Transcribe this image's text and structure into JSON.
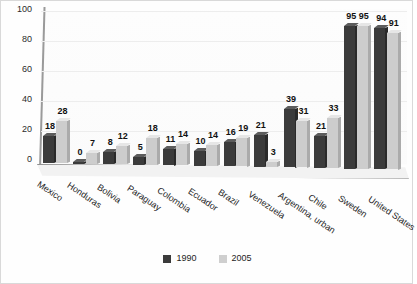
{
  "chart_data": {
    "type": "bar",
    "title": "",
    "xlabel": "",
    "ylabel": "",
    "ylim": [
      0,
      100
    ],
    "yticks": [
      0,
      20,
      40,
      60,
      80,
      100
    ],
    "grid": true,
    "legend_position": "bottom",
    "categories": [
      "Mexico",
      "Honduras",
      "Bolivia",
      "Paraguay",
      "Colombia",
      "Ecuador",
      "Brazil",
      "Venezuela",
      "Argentina, urban",
      "Chile",
      "Sweden",
      "United States"
    ],
    "series": [
      {
        "name": "1990",
        "color": "#3b3b3b",
        "values": [
          18,
          0,
          8,
          5,
          11,
          10,
          16,
          21,
          39,
          21,
          95,
          94
        ]
      },
      {
        "name": "2005",
        "color": "#cdcdcd",
        "values": [
          28,
          7,
          12,
          18,
          14,
          14,
          19,
          3,
          31,
          33,
          95,
          91
        ]
      }
    ]
  },
  "legend": {
    "items": [
      {
        "label": "1990",
        "swatch": "dark-gray-swatch"
      },
      {
        "label": "2005",
        "swatch": "light-gray-swatch"
      }
    ]
  }
}
